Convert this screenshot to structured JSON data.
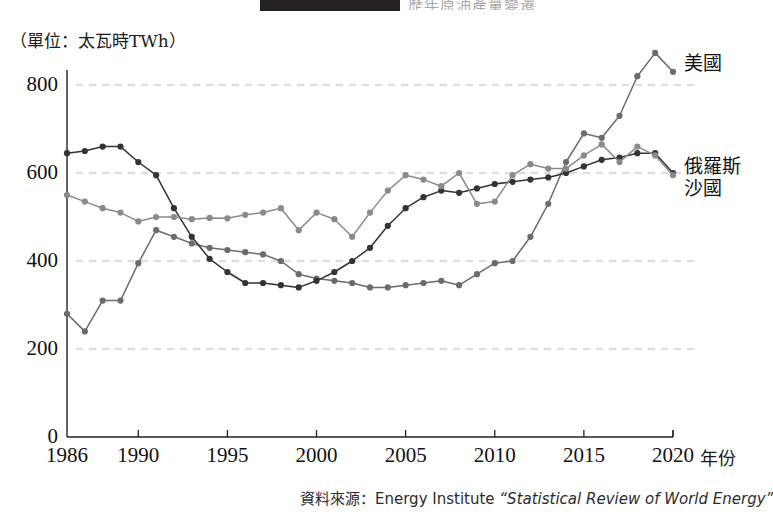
{
  "figure": {
    "unit_label": "（單位：太瓦時TWh）",
    "x_axis_name": "年份",
    "source_prefix": "資料來源：Energy Institute ",
    "source_title": "“Statistical Review of World Energy”",
    "title_strip_text": "歷年原油產量變遷"
  },
  "colors": {
    "usa": "#6b6b6b",
    "russia": "#333333",
    "saudi": "#8a8a8a",
    "grid": "#b9b9b9",
    "axis": "#222222",
    "background": "#ffffff"
  },
  "chart_data": {
    "type": "line",
    "title": "",
    "xlabel": "年份",
    "ylabel": "（單位：太瓦時TWh）",
    "xlim": [
      1986,
      2020
    ],
    "ylim": [
      0,
      900
    ],
    "yticks": [
      0,
      200,
      400,
      600,
      800
    ],
    "xticks": [
      1986,
      1990,
      1995,
      2000,
      2005,
      2010,
      2015,
      2020
    ],
    "grid": "horizontal-dashed",
    "legend": "right-inline",
    "x": [
      1986,
      1987,
      1988,
      1989,
      1990,
      1991,
      1992,
      1993,
      1994,
      1995,
      1996,
      1997,
      1998,
      1999,
      2000,
      2001,
      2002,
      2003,
      2004,
      2005,
      2006,
      2007,
      2008,
      2009,
      2010,
      2011,
      2012,
      2013,
      2014,
      2015,
      2016,
      2017,
      2018,
      2019,
      2020
    ],
    "series": [
      {
        "name": "美國",
        "label": "美國",
        "color": "#6b6b6b",
        "values": [
          280,
          240,
          310,
          310,
          395,
          470,
          455,
          440,
          430,
          425,
          420,
          415,
          400,
          370,
          360,
          355,
          350,
          340,
          340,
          345,
          350,
          355,
          345,
          370,
          395,
          400,
          455,
          530,
          625,
          690,
          680,
          730,
          820,
          873,
          830
        ]
      },
      {
        "name": "俄羅斯",
        "label": "俄羅斯",
        "color": "#333333",
        "values": [
          645,
          650,
          660,
          660,
          625,
          595,
          520,
          455,
          405,
          375,
          350,
          350,
          345,
          340,
          355,
          375,
          400,
          430,
          480,
          520,
          545,
          560,
          555,
          565,
          575,
          580,
          585,
          590,
          600,
          615,
          630,
          635,
          645,
          645,
          600
        ]
      },
      {
        "name": "沙國",
        "label": "沙國",
        "color": "#8a8a8a",
        "values": [
          550,
          535,
          520,
          510,
          490,
          500,
          500,
          495,
          498,
          497,
          505,
          510,
          520,
          470,
          510,
          495,
          455,
          510,
          560,
          595,
          585,
          570,
          600,
          530,
          535,
          595,
          620,
          610,
          610,
          640,
          665,
          625,
          660,
          640,
          595
        ]
      }
    ]
  },
  "axis_ticks": {
    "y": [
      "800",
      "600",
      "400",
      "200",
      "0"
    ],
    "x": [
      "1986",
      "1990",
      "1995",
      "2000",
      "2005",
      "2010",
      "2015",
      "2020"
    ]
  }
}
